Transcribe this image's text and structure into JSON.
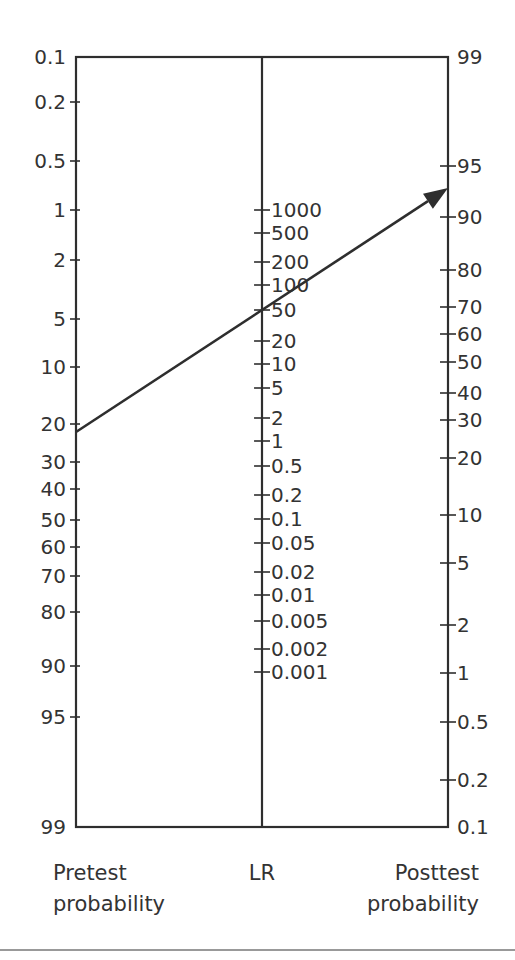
{
  "chart_data": {
    "type": "nomogram",
    "axes": [
      {
        "name": "Pretest probability",
        "label_line1": "Pretest",
        "label_line2": "probability",
        "x": 76,
        "ticks": [
          {
            "label": "0.1",
            "y": 57,
            "tick": false
          },
          {
            "label": "0.2",
            "y": 102
          },
          {
            "label": "0.5",
            "y": 161
          },
          {
            "label": "1",
            "y": 210
          },
          {
            "label": "2",
            "y": 260
          },
          {
            "label": "5",
            "y": 319
          },
          {
            "label": "10",
            "y": 367
          },
          {
            "label": "20",
            "y": 424
          },
          {
            "label": "30",
            "y": 462
          },
          {
            "label": "40",
            "y": 489
          },
          {
            "label": "50",
            "y": 520
          },
          {
            "label": "60",
            "y": 547
          },
          {
            "label": "70",
            "y": 576
          },
          {
            "label": "80",
            "y": 612
          },
          {
            "label": "90",
            "y": 666
          },
          {
            "label": "95",
            "y": 717
          },
          {
            "label": "99",
            "y": 827,
            "tick": false
          }
        ]
      },
      {
        "name": "LR",
        "label_line1": "LR",
        "x": 262,
        "ticks": [
          {
            "label": "1000",
            "y": 210
          },
          {
            "label": "500",
            "y": 233
          },
          {
            "label": "200",
            "y": 262
          },
          {
            "label": "100",
            "y": 285
          },
          {
            "label": "50",
            "y": 310
          },
          {
            "label": "20",
            "y": 341
          },
          {
            "label": "10",
            "y": 364
          },
          {
            "label": "5",
            "y": 388
          },
          {
            "label": "2",
            "y": 418
          },
          {
            "label": "1",
            "y": 441
          },
          {
            "label": "0.5",
            "y": 466
          },
          {
            "label": "0.2",
            "y": 495
          },
          {
            "label": "0.1",
            "y": 519
          },
          {
            "label": "0.05",
            "y": 543
          },
          {
            "label": "0.02",
            "y": 572
          },
          {
            "label": "0.01",
            "y": 595
          },
          {
            "label": "0.005",
            "y": 621
          },
          {
            "label": "0.002",
            "y": 649
          },
          {
            "label": "0.001",
            "y": 672
          }
        ]
      },
      {
        "name": "Posttest probability",
        "label_line1": "Posttest",
        "label_line2": "probability",
        "x": 448,
        "ticks": [
          {
            "label": "99",
            "y": 57,
            "tick": false
          },
          {
            "label": "95",
            "y": 166
          },
          {
            "label": "90",
            "y": 217
          },
          {
            "label": "80",
            "y": 270
          },
          {
            "label": "70",
            "y": 307
          },
          {
            "label": "60",
            "y": 334
          },
          {
            "label": "50",
            "y": 362
          },
          {
            "label": "40",
            "y": 393
          },
          {
            "label": "30",
            "y": 420
          },
          {
            "label": "20",
            "y": 458
          },
          {
            "label": "10",
            "y": 515
          },
          {
            "label": "5",
            "y": 563
          },
          {
            "label": "2",
            "y": 625
          },
          {
            "label": "1",
            "y": 673
          },
          {
            "label": "0.5",
            "y": 722
          },
          {
            "label": "0.2",
            "y": 780
          },
          {
            "label": "0.1",
            "y": 827,
            "tick": false
          }
        ]
      }
    ],
    "example_line": {
      "pretest_probability": 22,
      "likelihood_ratio": 50,
      "posttest_probability": 93,
      "start": [
        76,
        432
      ],
      "end": [
        448,
        188
      ]
    },
    "frame": {
      "top": 57,
      "bottom": 827,
      "left": 76,
      "right": 448
    },
    "separator_y": 950
  }
}
